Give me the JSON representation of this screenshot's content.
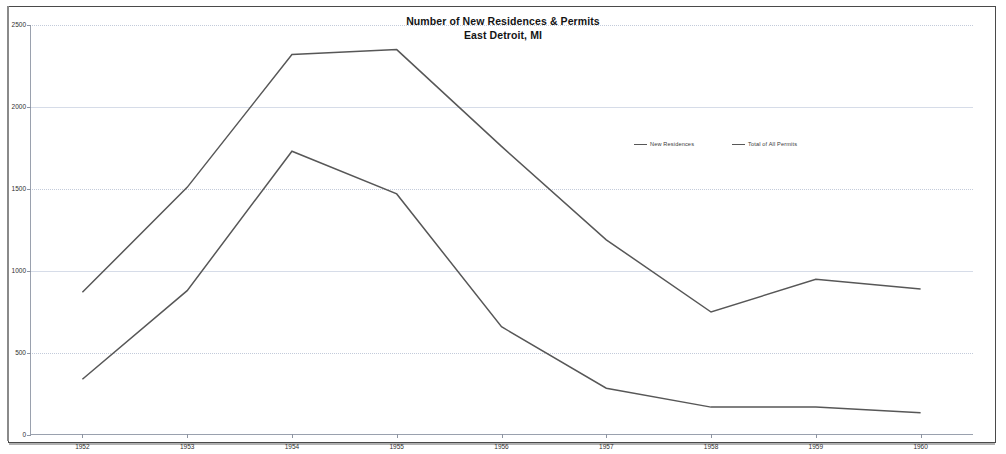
{
  "document": {
    "kind": "scanned-chart-page"
  },
  "chart_data": {
    "type": "line",
    "title": "Number of New Residences & Permits",
    "subtitle": "East Detroit, MI",
    "xlabel": "",
    "ylabel": "",
    "categories": [
      "1952",
      "1953",
      "1954",
      "1955",
      "1956",
      "1957",
      "1958",
      "1959",
      "1960"
    ],
    "ylim": [
      0,
      2500
    ],
    "yticks": [
      0,
      500,
      1000,
      1500,
      2000,
      2500
    ],
    "ytick_labels": [
      "0",
      "500",
      "1000",
      "1500",
      "2000",
      "2500"
    ],
    "grid": true,
    "legend_position": "center",
    "series": [
      {
        "name": "New Residences",
        "color": "#575757",
        "values": [
          340,
          880,
          1730,
          1470,
          660,
          285,
          170,
          170,
          135
        ]
      },
      {
        "name": "Total of All Permits",
        "color": "#575757",
        "values": [
          870,
          1510,
          2320,
          2350,
          1760,
          1190,
          750,
          950,
          890
        ]
      }
    ]
  }
}
